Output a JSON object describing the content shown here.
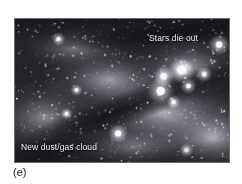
{
  "figure": {
    "caption": "(e)",
    "medium": "grayscale astronomical photograph"
  },
  "photo": {
    "labels": [
      {
        "id": "stars-die-out",
        "text": "Stars die out",
        "color": "#f2f2f2",
        "position": "upper-right"
      },
      {
        "id": "new-dust-gas-cloud",
        "text": "New dust/gas cloud",
        "color": "#f2f2f2",
        "position": "lower-left"
      }
    ],
    "colors": {
      "background_page": "#ffffff",
      "frame_border": "#6b6b6b",
      "nebula_bright": "#d8d8d8",
      "nebula_mid": "#8a8a8a",
      "dust_lane_dark": "#2b2b2b",
      "star_white": "#ffffff",
      "caption_text": "#1a1a1a"
    },
    "features": {
      "dust_lane_angle_deg": -20,
      "dust_lane_description": "dark diagonal band running lower-left to upper-right",
      "top_edge_band": "dark mottled band along upper edge",
      "star_cluster_count": 7,
      "star_cluster_region": "upper-right"
    }
  },
  "scene_data": {
    "type": "scatter",
    "nebula_clouds": [
      {
        "cx": 30,
        "cy": 100,
        "rx": 62,
        "ry": 40,
        "brightness": 0.5
      },
      {
        "cx": 95,
        "cy": 62,
        "rx": 70,
        "ry": 34,
        "brightness": 0.62
      },
      {
        "cx": 150,
        "cy": 95,
        "rx": 80,
        "ry": 42,
        "brightness": 0.7
      },
      {
        "cx": 200,
        "cy": 120,
        "rx": 60,
        "ry": 40,
        "brightness": 0.66
      },
      {
        "cx": 175,
        "cy": 48,
        "rx": 55,
        "ry": 30,
        "brightness": 0.58
      },
      {
        "cx": 60,
        "cy": 30,
        "rx": 55,
        "ry": 22,
        "brightness": 0.42
      },
      {
        "cx": 120,
        "cy": 130,
        "rx": 70,
        "ry": 26,
        "brightness": 0.44
      }
    ],
    "dark_lanes": [
      {
        "cx": 108,
        "cy": 92,
        "rx": 130,
        "ry": 17,
        "angle": -20,
        "depth": 0.88
      },
      {
        "cx": 150,
        "cy": 16,
        "rx": 110,
        "ry": 13,
        "angle": -5,
        "depth": 0.8
      },
      {
        "cx": 40,
        "cy": 132,
        "rx": 48,
        "ry": 15,
        "angle": -12,
        "depth": 0.7
      },
      {
        "cx": 205,
        "cy": 60,
        "rx": 40,
        "ry": 18,
        "angle": -25,
        "depth": 0.45
      }
    ],
    "bright_stars": [
      {
        "cx": 168,
        "cy": 52,
        "r": 5.4,
        "glow": 13
      },
      {
        "cx": 150,
        "cy": 58,
        "r": 4.6,
        "glow": 11
      },
      {
        "cx": 147,
        "cy": 73,
        "r": 5.8,
        "glow": 14
      },
      {
        "cx": 175,
        "cy": 68,
        "r": 3.2,
        "glow": 8
      },
      {
        "cx": 191,
        "cy": 56,
        "r": 3.0,
        "glow": 8
      },
      {
        "cx": 160,
        "cy": 84,
        "r": 2.6,
        "glow": 7
      },
      {
        "cx": 206,
        "cy": 26,
        "r": 4.4,
        "glow": 11
      },
      {
        "cx": 104,
        "cy": 116,
        "r": 4.2,
        "glow": 10
      },
      {
        "cx": 44,
        "cy": 20,
        "r": 2.6,
        "glow": 7
      },
      {
        "cx": 62,
        "cy": 72,
        "r": 2.2,
        "glow": 6
      },
      {
        "cx": 52,
        "cy": 96,
        "r": 2.4,
        "glow": 6
      },
      {
        "cx": 173,
        "cy": 133,
        "r": 2.6,
        "glow": 7
      }
    ],
    "star_field_count": 520,
    "grain_count": 900
  }
}
